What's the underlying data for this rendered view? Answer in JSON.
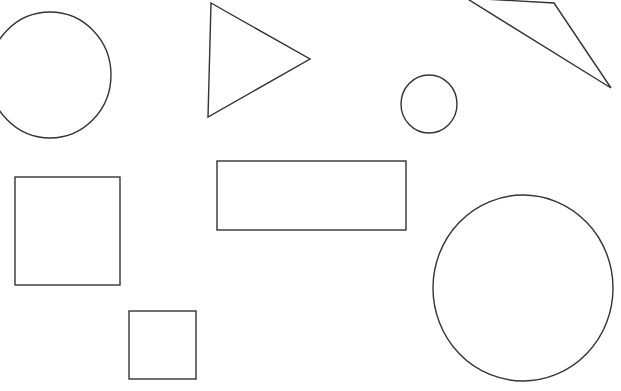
{
  "canvas": {
    "width": 621,
    "height": 391,
    "background": "#ffffff",
    "stroke": "#333333",
    "stroke_width": 1.4
  },
  "shapes": [
    {
      "type": "ellipse",
      "name": "circle-top-left",
      "cx": 50,
      "cy": 75,
      "rx": 61,
      "ry": 63
    },
    {
      "type": "polygon",
      "name": "triangle-top-center",
      "points": [
        [
          211,
          3
        ],
        [
          310,
          59
        ],
        [
          208,
          117
        ]
      ]
    },
    {
      "type": "polygon",
      "name": "triangle-top-right",
      "points": [
        [
          466,
          -2
        ],
        [
          554,
          3
        ],
        [
          611,
          88
        ]
      ]
    },
    {
      "type": "ellipse",
      "name": "circle-small",
      "cx": 429,
      "cy": 104,
      "rx": 28,
      "ry": 29
    },
    {
      "type": "rect",
      "name": "square-left",
      "x": 15,
      "y": 177,
      "w": 105,
      "h": 108
    },
    {
      "type": "rect",
      "name": "rectangle-wide",
      "x": 217,
      "y": 161,
      "w": 189,
      "h": 69
    },
    {
      "type": "rect",
      "name": "square-small",
      "x": 129,
      "y": 311,
      "w": 67,
      "h": 68
    },
    {
      "type": "ellipse",
      "name": "circle-large",
      "cx": 523,
      "cy": 288,
      "rx": 90,
      "ry": 93
    }
  ]
}
